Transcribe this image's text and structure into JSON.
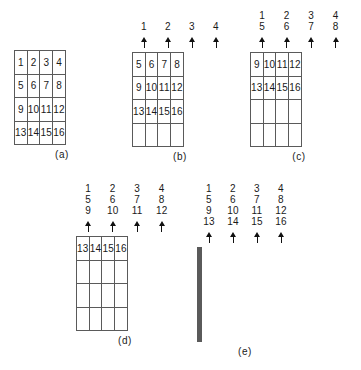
{
  "figure": {
    "background": "#ffffff",
    "line_color": "#5a5a5a",
    "text_color": "#1a1a1a",
    "trailing_caption": ""
  },
  "panels": [
    {
      "id": "a",
      "caption": "(a)",
      "has_arrows": false,
      "label_columns": [
        [],
        [],
        [],
        []
      ],
      "grid": [
        [
          "1",
          "2",
          "3",
          "4"
        ],
        [
          "5",
          "6",
          "7",
          "8"
        ],
        [
          "9",
          "10",
          "11",
          "12"
        ],
        [
          "13",
          "14",
          "15",
          "16"
        ]
      ]
    },
    {
      "id": "b",
      "caption": "(b)",
      "has_arrows": true,
      "label_columns": [
        [
          "1"
        ],
        [
          "2"
        ],
        [
          "3"
        ],
        [
          "4"
        ]
      ],
      "grid": [
        [
          "5",
          "6",
          "7",
          "8"
        ],
        [
          "9",
          "10",
          "11",
          "12"
        ],
        [
          "13",
          "14",
          "15",
          "16"
        ],
        [
          "",
          "",
          "",
          ""
        ]
      ]
    },
    {
      "id": "c",
      "caption": "(c)",
      "has_arrows": true,
      "label_columns": [
        [
          "1",
          "5"
        ],
        [
          "2",
          "6"
        ],
        [
          "3",
          "7"
        ],
        [
          "4",
          "8"
        ]
      ],
      "grid": [
        [
          "9",
          "10",
          "11",
          "12"
        ],
        [
          "13",
          "14",
          "15",
          "16"
        ],
        [
          "",
          "",
          "",
          ""
        ],
        [
          "",
          "",
          "",
          ""
        ]
      ]
    },
    {
      "id": "d",
      "caption": "(d)",
      "has_arrows": true,
      "label_columns": [
        [
          "1",
          "5",
          "9"
        ],
        [
          "2",
          "6",
          "10"
        ],
        [
          "3",
          "7",
          "11"
        ],
        [
          "4",
          "8",
          "12"
        ]
      ],
      "grid": [
        [
          "13",
          "14",
          "15",
          "16"
        ],
        [
          "",
          "",
          "",
          ""
        ],
        [
          "",
          "",
          "",
          ""
        ],
        [
          "",
          "",
          "",
          ""
        ]
      ]
    },
    {
      "id": "e",
      "caption": "(e)",
      "has_arrows": true,
      "label_columns": [
        [
          "1",
          "5",
          "9",
          "13"
        ],
        [
          "2",
          "6",
          "10",
          "14"
        ],
        [
          "3",
          "7",
          "11",
          "15"
        ],
        [
          "4",
          "8",
          "12",
          "16"
        ]
      ],
      "grid": [
        [
          "",
          "",
          "",
          ""
        ],
        [
          "",
          "",
          "",
          ""
        ],
        [
          "",
          "",
          "",
          ""
        ],
        [
          "",
          "",
          "",
          ""
        ]
      ]
    }
  ]
}
